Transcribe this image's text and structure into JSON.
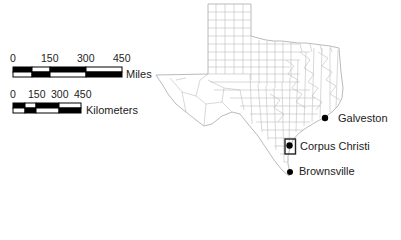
{
  "scale_bars": {
    "miles": {
      "ticks": [
        "0",
        "150",
        "300",
        "450"
      ],
      "unit_label": "Miles"
    },
    "kilometers": {
      "ticks": [
        "0",
        "150",
        "300",
        "450"
      ],
      "unit_label": "Kilometers"
    }
  },
  "map": {
    "region": "Texas counties",
    "cities": [
      {
        "name": "Galveston",
        "marker": "dot"
      },
      {
        "name": "Corpus Christi",
        "marker": "dot-boxed"
      },
      {
        "name": "Brownsville",
        "marker": "dot"
      }
    ],
    "colors": {
      "county_line": "#b8b8b8",
      "marker": "#000000",
      "background": "#ffffff"
    }
  }
}
